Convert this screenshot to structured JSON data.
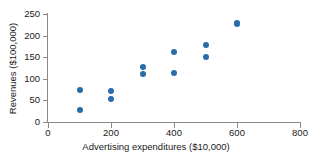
{
  "chart_data": {
    "type": "scatter",
    "title": "",
    "xlabel": "Advertising expenditures ($10,000)",
    "ylabel": "Revenues ($100,000)",
    "xlim": [
      0,
      800
    ],
    "ylim": [
      0,
      250
    ],
    "xticks": [
      0,
      200,
      400,
      600,
      800
    ],
    "yticks": [
      0,
      50,
      100,
      150,
      200,
      250
    ],
    "xtick_labels": [
      "0",
      "200",
      "400",
      "600",
      "800"
    ],
    "ytick_labels": [
      "0",
      "50",
      "100",
      "150",
      "200",
      "250"
    ],
    "grid": false,
    "legend": false,
    "marker_color": "#2b6cab",
    "axis_color": "#8a8a8a",
    "points": [
      {
        "x": 100,
        "y": 73
      },
      {
        "x": 100,
        "y": 28
      },
      {
        "x": 200,
        "y": 72
      },
      {
        "x": 200,
        "y": 54
      },
      {
        "x": 300,
        "y": 128
      },
      {
        "x": 300,
        "y": 110
      },
      {
        "x": 400,
        "y": 162
      },
      {
        "x": 400,
        "y": 114
      },
      {
        "x": 500,
        "y": 179
      },
      {
        "x": 500,
        "y": 150
      },
      {
        "x": 600,
        "y": 230
      },
      {
        "x": 600,
        "y": 226
      }
    ]
  }
}
